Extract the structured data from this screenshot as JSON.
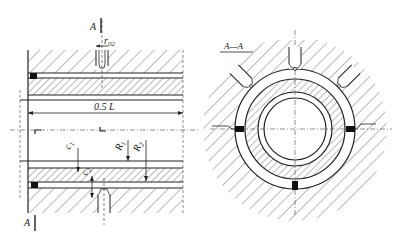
{
  "diagram": {
    "type": "engineering-drawing",
    "views": [
      {
        "name": "longitudinal-section",
        "description": "Half-length longitudinal section of bearing with housing, journal sleeve and injection nozzles"
      },
      {
        "name": "cross-section",
        "title": "A—A"
      }
    ],
    "labels": {
      "section_marker_top": "A",
      "section_marker_bottom": "A",
      "r02": "r",
      "r02_sub": "02",
      "length": "0.5 L",
      "c1": "c",
      "c1_sub": "1",
      "c2": "c",
      "c2_sub": "2",
      "R1": "R",
      "R1_sub": "1",
      "R2": "R",
      "R2_sub": "2",
      "section_title": "A—A"
    },
    "colors": {
      "line": "#222222",
      "hatch": "#555555",
      "pad": "#111111",
      "background": "#ffffff"
    }
  }
}
